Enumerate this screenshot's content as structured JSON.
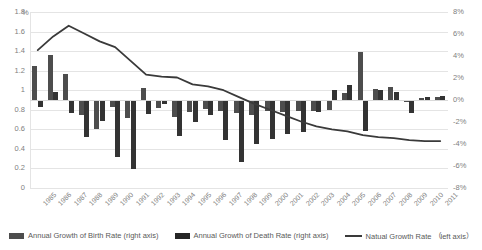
{
  "chart_data": {
    "type": "bar",
    "title": "",
    "xlabel": "",
    "ylabel": "",
    "unit_mark": "%",
    "grid": true,
    "legend_position": "bottom",
    "categories": [
      "1985",
      "1986",
      "1987",
      "1988",
      "1989",
      "1990",
      "1991",
      "1992",
      "1993",
      "1994",
      "1995",
      "1996",
      "1997",
      "1998",
      "1999",
      "2000",
      "2001",
      "2002",
      "2003",
      "2004",
      "2005",
      "2006",
      "2007",
      "2008",
      "2009",
      "2010",
      "2011"
    ],
    "left_axis": {
      "label": "Natual Growth Rate （left axis）",
      "min": 0,
      "max": 1.8,
      "step": 0.2,
      "ticks": [
        "0",
        "0.2",
        "0.4",
        "0.6",
        "0.8",
        "1",
        "1.2",
        "1.4",
        "1.6",
        "1.8"
      ]
    },
    "right_axis": {
      "label": "Annual Growth (right axis)",
      "min": -8,
      "max": 8,
      "step": 2,
      "ticks": [
        "8%",
        "6%",
        "4%",
        "2%",
        "0%",
        "-2%",
        "-4%",
        "-6%",
        "-8%"
      ]
    },
    "series": [
      {
        "name": "Annual Growth of Birth Rate (right axis)",
        "axis": "right",
        "type": "bar",
        "color": "#4d4d4d",
        "values": [
          3.1,
          4.1,
          2.4,
          -1.4,
          -2.6,
          -0.6,
          -1.6,
          1.1,
          -0.7,
          -1.5,
          -1.1,
          -0.8,
          -1.0,
          -1.2,
          -1.4,
          -1.0,
          -1.1,
          -1.0,
          -1.0,
          -0.9,
          0.6,
          4.4,
          1.0,
          1.2,
          -0.2,
          0.2,
          0.3
        ]
      },
      {
        "name": "Annual Growth of Death Rate (right axis)",
        "axis": "right",
        "type": "bar",
        "color": "#333333",
        "values": [
          -0.6,
          0.7,
          -1.2,
          -3.4,
          -1.9,
          -5.2,
          -6.3,
          -1.3,
          -0.4,
          -3.3,
          -2.0,
          -1.4,
          -3.6,
          -5.6,
          -4.0,
          -3.5,
          -3.1,
          -2.9,
          -1.1,
          0.9,
          1.4,
          -2.8,
          0.9,
          0.7,
          -1.2,
          0.3,
          0.4
        ]
      },
      {
        "name": "Natual Growth Rate （left axis）",
        "axis": "left",
        "type": "line",
        "color": "#3a3a3a",
        "values": [
          1.41,
          1.55,
          1.66,
          1.58,
          1.5,
          1.44,
          1.3,
          1.16,
          1.14,
          1.13,
          1.06,
          1.04,
          1.0,
          0.93,
          0.86,
          0.8,
          0.74,
          0.68,
          0.63,
          0.6,
          0.58,
          0.54,
          0.52,
          0.51,
          0.49,
          0.48,
          0.48
        ]
      }
    ]
  },
  "legend": {
    "items": [
      {
        "label": "Annual Growth of Birth Rate (right axis)",
        "swatch": "bar-birth-swatch"
      },
      {
        "label": "Annual Growth of Death Rate (right axis)",
        "swatch": "bar-death-swatch"
      },
      {
        "label": "Natual Growth Rate  （left axis）",
        "swatch": "line-swatch"
      }
    ]
  }
}
